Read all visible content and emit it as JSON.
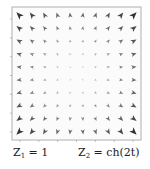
{
  "figure": {
    "captions": {
      "left": {
        "var": "Z",
        "sub": "1",
        "rest": " = 1"
      },
      "right": {
        "var": "Z",
        "sub": "2",
        "rest": " = ch(2t)"
      }
    }
  },
  "chart_data": {
    "type": "quiver",
    "title": "",
    "xlabel": "",
    "ylabel": "",
    "grid": false,
    "frame": {
      "x0": 12,
      "y0": 7,
      "x1": 141,
      "y1": 140,
      "color": "#b0b0b0"
    },
    "xticks_count": 7,
    "yticks_count": 7,
    "tick_labels_legible": false,
    "grid_cols": 10,
    "grid_rows": 10,
    "field_description": "Vector field pointing outward from the center toward the corners; magnitude grows with distance from center, largest and darkest at the four corners.",
    "arrow_color": "#3a3a3a"
  }
}
